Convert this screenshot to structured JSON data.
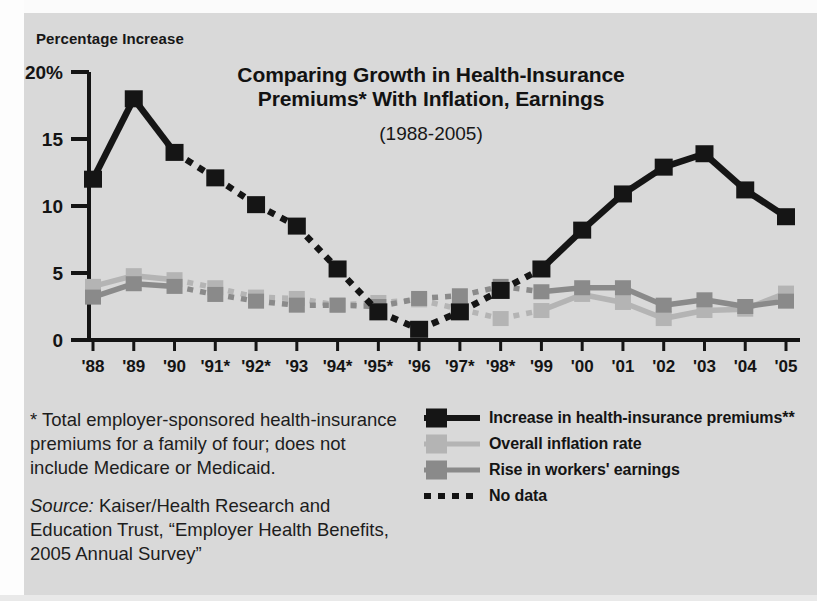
{
  "figure": {
    "y_axis_title": "Percentage Increase",
    "title_line1": "Comparing Growth in Health-Insurance",
    "title_line2": "Premiums* With Inflation, Earnings",
    "subtitle": "(1988-2005)"
  },
  "colors": {
    "background": "#d9d9d9",
    "premiums": "#151515",
    "inflation": "#b4b4b4",
    "earnings": "#8a8a8a",
    "axis": "#141414",
    "text": "#171717"
  },
  "notes": {
    "footnote": "* Total employer-sponsored health-insurance premiums for a family of four; does not include Medicare or Medicaid.",
    "source_label": "Source:",
    "source_text": " Kaiser/Health Research and Education Trust, “Employer Health Benefits, 2005 Annual Survey”"
  },
  "legend": {
    "position": "bottom-right",
    "items": [
      {
        "label": "Increase in health-insurance premiums**",
        "color": "#151515",
        "style": "solid-square"
      },
      {
        "label": "Overall inflation rate",
        "color": "#b4b4b4",
        "style": "solid-square"
      },
      {
        "label": "Rise in workers' earnings",
        "color": "#8a8a8a",
        "style": "solid-square"
      },
      {
        "label": "No data",
        "color": "#131313",
        "style": "dotted"
      }
    ]
  },
  "chart_data": {
    "type": "line",
    "title": "Comparing Growth in Health-Insurance Premiums* With Inflation, Earnings (1988-2005)",
    "xlabel": "",
    "ylabel": "Percentage Increase",
    "ylim": [
      0,
      20
    ],
    "yticks": [
      0,
      5,
      10,
      15,
      20
    ],
    "ytick_labels": [
      "0",
      "5",
      "10",
      "15",
      "20%"
    ],
    "grid": false,
    "categories": [
      "'88",
      "'89",
      "'90",
      "'91*",
      "'92*",
      "'93",
      "'94*",
      "'95*",
      "'96",
      "'97*",
      "'98*",
      "'99",
      "'00",
      "'01",
      "'02",
      "'03",
      "'04",
      "'05"
    ],
    "years": [
      1988,
      1989,
      1990,
      1991,
      1992,
      1993,
      1994,
      1995,
      1996,
      1997,
      1998,
      1999,
      2000,
      2001,
      2002,
      2003,
      2004,
      2005
    ],
    "no_data_years": [
      "'91*",
      "'92*",
      "'94*",
      "'95*",
      "'97*",
      "'98*"
    ],
    "series": [
      {
        "name": "Increase in health-insurance premiums**",
        "color": "#151515",
        "values": [
          12.0,
          18.0,
          14.0,
          12.1,
          10.1,
          8.5,
          5.3,
          2.1,
          0.8,
          2.1,
          3.7,
          5.3,
          8.2,
          10.9,
          12.9,
          13.9,
          11.2,
          9.2
        ]
      },
      {
        "name": "Overall inflation rate",
        "color": "#b4b4b4",
        "values": [
          4.0,
          4.8,
          4.5,
          3.9,
          3.2,
          3.1,
          2.6,
          2.8,
          3.0,
          2.3,
          1.6,
          2.2,
          3.4,
          2.8,
          1.6,
          2.2,
          2.3,
          3.5
        ]
      },
      {
        "name": "Rise in workers' earnings",
        "color": "#8a8a8a",
        "values": [
          3.2,
          4.2,
          4.0,
          3.4,
          2.9,
          2.6,
          2.6,
          2.5,
          3.1,
          3.3,
          4.0,
          3.6,
          3.9,
          3.9,
          2.6,
          3.0,
          2.5,
          2.9
        ]
      }
    ]
  }
}
